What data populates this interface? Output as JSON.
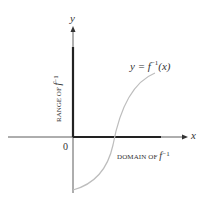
{
  "diagram": {
    "x_axis_label": "x",
    "y_axis_label": "y",
    "origin_label": "0",
    "curve_label": {
      "lhs": "y = ",
      "func": "f",
      "exponent": "−1",
      "arg": "(x)"
    },
    "domain_label": {
      "text": "DOMAIN OF ",
      "func": "f",
      "exponent": "−1"
    },
    "range_label": {
      "text": "RANGE OF ",
      "func": "f",
      "exponent": "−1"
    },
    "colors": {
      "axis": "#333333",
      "highlight_bar": "#222222",
      "curve": "#bdbdbd",
      "text": "#333333"
    }
  }
}
